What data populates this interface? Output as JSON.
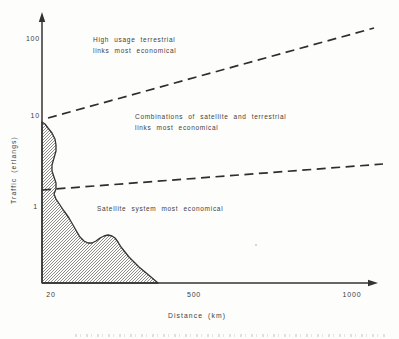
{
  "figure": {
    "background": "#fdfdfc",
    "ink_color": "#333333",
    "hatch_color": "#6f6f6f"
  },
  "labels": {
    "y_axis_title": "Traffic (erlangs)",
    "x_axis_title": "Distance (km)",
    "y_ticks": [
      "100",
      "10",
      "1"
    ],
    "x_ticks": [
      "20",
      "500",
      "1000"
    ],
    "region_high": [
      "High usage terrestrial",
      "links most economical"
    ],
    "region_mid": [
      "Combinations of satellite and terrestrial",
      "links most economical"
    ],
    "region_low": "Satellite system most economical"
  },
  "chart_data": {
    "type": "area",
    "title": "",
    "xlabel": "Distance (km)",
    "ylabel": "Traffic (erlangs)",
    "x_tick_labels": [
      "20",
      "500",
      "1000"
    ],
    "y_tick_labels": [
      "1",
      "10",
      "100"
    ],
    "y_scale": "log",
    "xlim": [
      20,
      1100
    ],
    "ylim": [
      0.3,
      200
    ],
    "grid": false,
    "legend": "none",
    "annotations": [
      "High usage terrestrial links most economical",
      "Combinations of satellite and terrestrial links most economical",
      "Satellite system most economical"
    ],
    "boundary_lines": [
      {
        "name": "upper-boundary",
        "style": "dashed",
        "data_points": [
          {
            "x": 20,
            "y": 10
          },
          {
            "x": 1070,
            "y": 150
          }
        ],
        "px": [
          [
            48,
            118
          ],
          [
            374,
            28
          ]
        ]
      },
      {
        "name": "lower-boundary",
        "style": "dashed",
        "data_points": [
          {
            "x": 20,
            "y": 1.6
          },
          {
            "x": 1100,
            "y": 3
          }
        ],
        "px": [
          [
            42,
            190
          ],
          [
            383,
            164
          ]
        ]
      }
    ],
    "hatched_area": {
      "name": "satellite-region-traffic-profile",
      "fill": "diagonal-hatch",
      "peak_data_value": {
        "x": 20,
        "y": 8
      },
      "outline_px": [
        [
          42,
          122
        ],
        [
          45,
          124
        ],
        [
          48,
          128
        ],
        [
          52,
          133
        ],
        [
          55,
          139
        ],
        [
          56,
          145
        ],
        [
          56,
          151
        ],
        [
          54,
          158
        ],
        [
          52,
          165
        ],
        [
          52,
          171
        ],
        [
          54,
          177
        ],
        [
          56,
          183
        ],
        [
          56,
          189
        ],
        [
          54,
          194
        ],
        [
          56,
          199
        ],
        [
          60,
          205
        ],
        [
          64,
          211
        ],
        [
          69,
          218
        ],
        [
          73,
          225
        ],
        [
          77,
          232
        ],
        [
          80,
          237
        ],
        [
          84,
          241
        ],
        [
          88,
          243
        ],
        [
          92,
          243
        ],
        [
          96,
          241
        ],
        [
          100,
          238
        ],
        [
          104,
          236
        ],
        [
          108,
          235
        ],
        [
          112,
          236
        ],
        [
          115,
          238
        ],
        [
          118,
          242
        ],
        [
          121,
          247
        ],
        [
          125,
          252
        ],
        [
          129,
          257
        ],
        [
          134,
          262
        ],
        [
          139,
          267
        ],
        [
          145,
          272
        ],
        [
          151,
          277
        ],
        [
          158,
          283
        ],
        [
          42,
          283
        ]
      ]
    },
    "axes_px": {
      "origin": [
        42,
        283
      ],
      "x_end": [
        378,
        283
      ],
      "y_end": [
        42,
        12
      ],
      "x_tick_px": [
        51,
        194,
        352
      ],
      "y_tick_px": [
        40,
        117,
        208
      ]
    }
  }
}
